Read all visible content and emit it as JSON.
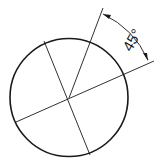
{
  "diagram": {
    "type": "angular dimension drawing",
    "circle": {
      "cx": 69,
      "cy": 97.5,
      "r": 59.5
    },
    "angle_label": "45°",
    "lines": [
      {
        "name": "diameter-a",
        "x1": 44,
        "y1": 41,
        "x2": 90,
        "y2": 155
      },
      {
        "name": "extension-line",
        "x1": 69,
        "y1": 98,
        "x2": 103,
        "y2": 8
      },
      {
        "name": "extension-line-2",
        "x1": 16,
        "y1": 122,
        "x2": 154,
        "y2": 61
      }
    ],
    "stroke_color": "#1a1a1a"
  }
}
